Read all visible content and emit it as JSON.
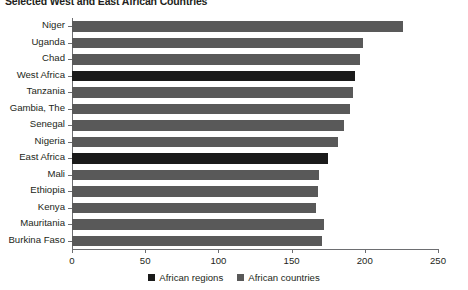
{
  "chart_data": {
    "type": "bar",
    "orientation": "horizontal",
    "title": "Selected West and East African Countries",
    "xlabel": "",
    "ylabel": "",
    "xlim": [
      0,
      250
    ],
    "xticks": [
      0,
      50,
      100,
      150,
      200,
      250
    ],
    "grid": false,
    "legend_position": "bottom-center",
    "categories": [
      "Niger",
      "Uganda",
      "Chad",
      "West Africa",
      "Tanzania",
      "Gambia, The",
      "Senegal",
      "Nigeria",
      "East Africa",
      "Mali",
      "Ethiopia",
      "Kenya",
      "Mauritania",
      "Burkina Faso"
    ],
    "values": [
      226,
      199,
      197,
      193,
      192,
      190,
      186,
      182,
      175,
      169,
      168,
      167,
      172,
      171
    ],
    "series_of": [
      "African countries",
      "African countries",
      "African countries",
      "African regions",
      "African countries",
      "African countries",
      "African countries",
      "African countries",
      "African regions",
      "African countries",
      "African countries",
      "African countries",
      "African countries",
      "African countries"
    ],
    "legend": [
      {
        "name": "African regions",
        "color": "#1a1a1a"
      },
      {
        "name": "African countries",
        "color": "#595959"
      }
    ]
  }
}
